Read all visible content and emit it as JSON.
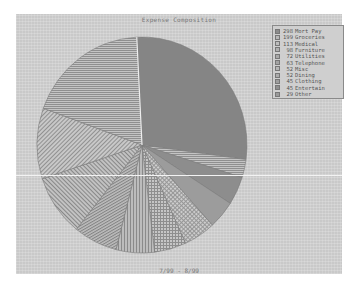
{
  "chart_data": {
    "type": "pie",
    "title": "Expense Composition",
    "subtitle": "7/99 - 8/99",
    "start_angle": "top, clockwise",
    "legend_position": "top-right",
    "categories": [
      "Mort Pay",
      "Groceries",
      "Medical",
      "Furniture",
      "Utilities",
      "Telephone",
      "Misc",
      "Dining",
      "Clothing",
      "Entertain",
      "Other"
    ],
    "values": [
      298,
      199,
      113,
      98,
      72,
      63,
      52,
      52,
      45,
      45,
      29
    ],
    "legend_entries": [
      "298 Mort Pay",
      "199 Groceries",
      "113 Medical",
      "98 Furniture",
      "72 Utilities",
      "63 Telephone",
      "52 Misc",
      "52 Dining",
      "45 Clothing",
      "45 Entertain",
      "29 Other"
    ]
  },
  "legend": [
    {
      "value": "298",
      "label": "Mort Pay",
      "fill": "#8c8c8c"
    },
    {
      "value": "199",
      "label": "Groceries",
      "fill": "#b8b8b8"
    },
    {
      "value": "113",
      "label": "Medical",
      "fill": "#bdbdbd"
    },
    {
      "value": "98",
      "label": "Furniture",
      "fill": "#b0b0b0"
    },
    {
      "value": "72",
      "label": "Utilities",
      "fill": "#a9a9a9"
    },
    {
      "value": "63",
      "label": "Telephone",
      "fill": "#a3a3a3"
    },
    {
      "value": "52",
      "label": "Misc",
      "fill": "#b5b5b5"
    },
    {
      "value": "52",
      "label": "Dining",
      "fill": "#acacac"
    },
    {
      "value": "45",
      "label": "Clothing",
      "fill": "#9e9e9e"
    },
    {
      "value": "45",
      "label": "Entertain",
      "fill": "#8f8f8f"
    },
    {
      "value": "29",
      "label": "Other",
      "fill": "#9a9a9a"
    }
  ]
}
